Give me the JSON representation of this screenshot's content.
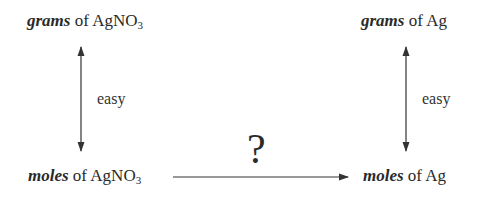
{
  "diagram": {
    "top_left": {
      "emphasis": "grams",
      "connector": " of ",
      "substance": "AgNO",
      "subscript": "3"
    },
    "top_right": {
      "emphasis": "grams",
      "connector": " of ",
      "substance": "Ag",
      "subscript": ""
    },
    "bottom_left": {
      "emphasis": "moles",
      "connector": " of ",
      "substance": "AgNO",
      "subscript": "3"
    },
    "bottom_right": {
      "emphasis": "moles",
      "connector": " of ",
      "substance": "Ag",
      "subscript": ""
    },
    "left_arrow_label": "easy",
    "right_arrow_label": "easy",
    "horizontal_arrow_label": "?",
    "colors": {
      "text": "#2a2a2a",
      "arrow": "#333333",
      "background": "#ffffff"
    }
  }
}
